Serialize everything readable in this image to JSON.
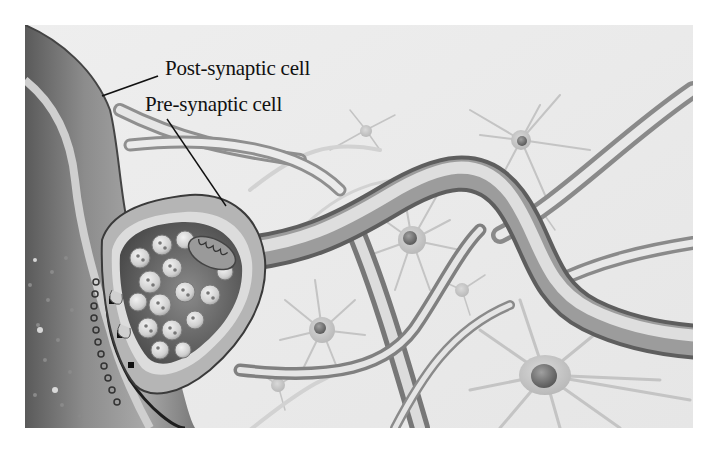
{
  "figure": {
    "labels": [
      {
        "id": "post",
        "text": "Post-synaptic cell"
      },
      {
        "id": "pre",
        "text": "Pre-synaptic cell"
      }
    ],
    "colors": {
      "background": "#ffffff",
      "frame_bg": "#ececec",
      "label_text": "#111111",
      "leader_line": "#111111",
      "membrane_dark": "#3a3a3a",
      "tissue_mid": "#9a9a9a"
    }
  }
}
